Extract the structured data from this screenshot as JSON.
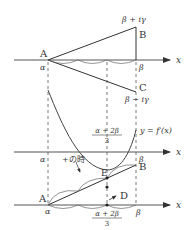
{
  "diagram": {
    "top": {
      "point_A": "A",
      "point_B": "B",
      "point_C": "C",
      "label_B_value": "β + iγ",
      "label_C_value": "β − iγ",
      "alpha": "α",
      "beta": "β",
      "axis": "x"
    },
    "middle": {
      "alpha": "α",
      "beta": "β",
      "axis": "x",
      "curve_label": "y = f′(x)",
      "frac_num": "α + 2β",
      "frac_den": "3"
    },
    "bottom": {
      "point_A": "A",
      "point_B": "B",
      "point_E": "E",
      "point_D": "D",
      "annotation": "+の時",
      "alpha": "α",
      "beta": "β",
      "axis": "x",
      "frac_num": "α + 2β",
      "frac_den": "3"
    },
    "colors": {
      "line": "#333333",
      "axis": "#555555",
      "curve": "#555555"
    }
  }
}
